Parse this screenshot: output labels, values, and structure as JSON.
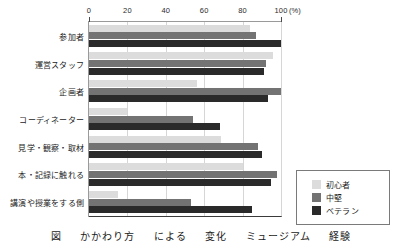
{
  "chart_data": {
    "type": "bar",
    "orientation": "horizontal",
    "title": "",
    "subtitle": "",
    "xlabel": "(%)",
    "ylabel": "",
    "xlim": [
      0,
      100
    ],
    "xticks": [
      0,
      20,
      40,
      60,
      80,
      100
    ],
    "xtick_labels": [
      "0",
      "20",
      "40",
      "60",
      "80",
      "100"
    ],
    "unit_label": "(%)",
    "grid": true,
    "legend_position": "bottom-right",
    "categories": [
      "参加者",
      "運営スタッフ",
      "企画者",
      "コーディネーター",
      "見学・観察・取材",
      "本・記録に触れる",
      "講演や授業をする側"
    ],
    "series": [
      {
        "name": "初心者",
        "color": "#dcdcdc",
        "values": [
          84,
          96,
          56,
          20,
          69,
          80,
          15
        ]
      },
      {
        "name": "中堅",
        "color": "#737373",
        "values": [
          87,
          92,
          100,
          54,
          88,
          98,
          53
        ]
      },
      {
        "name": "ベテラン",
        "color": "#2a2a2a",
        "values": [
          100,
          91,
          93,
          68,
          90,
          95,
          85
        ]
      }
    ]
  },
  "legend": {
    "items": [
      {
        "label": "初心者",
        "swatch": "s0"
      },
      {
        "label": "中堅",
        "swatch": "s1"
      },
      {
        "label": "ベテラン",
        "swatch": "s2"
      }
    ]
  },
  "caption": {
    "text": "図 　 かかわり方 　 による 　 変化 　 ミュージアム 　 経験"
  }
}
